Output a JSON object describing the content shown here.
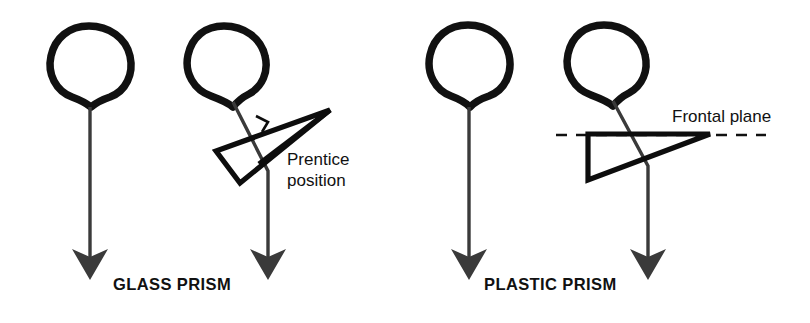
{
  "figure": {
    "background_color": "#ffffff",
    "width": 810,
    "height": 323,
    "colors": {
      "head_outline": "#111111",
      "gaze_line": "#3a3a3a",
      "prism_outline": "#0d0d0d",
      "dashed_plane": "#111111",
      "text": "#111111"
    }
  },
  "panels": [
    {
      "id": "glass",
      "caption": "GLASS PRISM",
      "figures": [
        {
          "id": "glass-plain-head",
          "kind": "head-with-arrow",
          "has_prism": false,
          "description": "head with straight vertical gaze arrow, no prism"
        },
        {
          "id": "glass-prism-head",
          "kind": "head-with-prism-and-arrow",
          "has_prism": true,
          "prism_type": "glass",
          "orientation": "tilted",
          "right_angle_marker": true,
          "description": "head with tilted glass prism in Prentice position, rear surface perpendicular to line of sight"
        }
      ],
      "annotations": [
        {
          "id": "prentice-position",
          "text": "Prentice\nposition",
          "lines": [
            "Prentice",
            "position"
          ],
          "has_leader_line": false
        }
      ]
    },
    {
      "id": "plastic",
      "caption": "PLASTIC PRISM",
      "figures": [
        {
          "id": "plastic-plain-head",
          "kind": "head-with-arrow",
          "has_prism": false,
          "description": "head with straight vertical gaze arrow, no prism"
        },
        {
          "id": "plastic-prism-head",
          "kind": "head-with-prism-and-arrow",
          "has_prism": true,
          "prism_type": "plastic",
          "orientation": "frontal-plane-aligned",
          "right_angle_marker": false,
          "description": "head with plastic prism aligned to the frontal plane, back surface parallel to the dashed frontal plane"
        }
      ],
      "annotations": [
        {
          "id": "frontal-plane",
          "text": "Frontal plane",
          "lines": [
            "Frontal plane"
          ],
          "has_leader_line": false,
          "reference_line_style": "dashed"
        }
      ]
    }
  ],
  "icons": {
    "head": "head-outline-icon",
    "arrow": "down-arrow-icon",
    "prism": "prism-triangle-icon",
    "right_angle": "right-angle-marker-icon",
    "dashed_plane": "dashed-frontal-plane-icon"
  }
}
